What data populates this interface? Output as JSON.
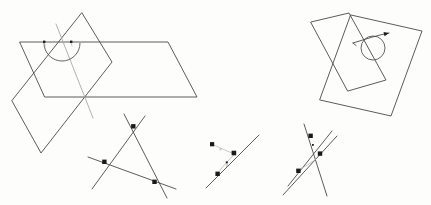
{
  "figure": {
    "background_color": "#fdfdfb",
    "width": 431,
    "height": 205,
    "stroke_color": "#4a4a4a",
    "accent_color": "#1a1a1a",
    "panels": [
      {
        "id": "panel-top-left",
        "name": "intersecting-planes-with-dihedral-angle",
        "description": "Two intersecting planes drawn as parallelograms with a dihedral angle arc and two right-angle tick marks on the line of intersection."
      },
      {
        "id": "panel-top-right",
        "name": "intersecting-planes-with-circle-and-arrow",
        "description": "Two overlapping parallelograms with a circle at the intersection region and an arrow pointing up-right."
      },
      {
        "id": "panel-bottom-left",
        "name": "triangle-from-three-lines",
        "description": "Three extended lines intersecting pairwise forming a triangle with three square vertex markers."
      },
      {
        "id": "panel-bottom-middle",
        "name": "line-with-offset-point",
        "description": "A diagonal line with two square markers and an offset square marker joined by a faint segment."
      },
      {
        "id": "panel-bottom-right",
        "name": "concurrent-lines-with-markers",
        "description": "Three lines crossing near a common region with four square markers."
      }
    ],
    "shapes": {
      "plane_a_left": [
        [
          20,
          42
        ],
        [
          168,
          42
        ],
        [
          197,
          97
        ],
        [
          45,
          97
        ]
      ],
      "plane_b_left": [
        [
          82,
          13
        ],
        [
          112,
          62
        ],
        [
          41,
          153
        ],
        [
          12,
          101
        ]
      ],
      "intersection_line_left": [
        [
          58,
          26
        ],
        [
          90,
          113
        ]
      ],
      "arc_left": {
        "cx": 62,
        "cy": 45,
        "r": 18
      },
      "ticks_left": [
        [
          44,
          43
        ],
        [
          71,
          42
        ]
      ],
      "plane_a_right": [
        [
          310,
          22
        ],
        [
          348,
          13
        ],
        [
          385,
          80
        ],
        [
          346,
          90
        ]
      ],
      "plane_b_right": [
        [
          325,
          44
        ],
        [
          365,
          33
        ],
        [
          421,
          47
        ],
        [
          381,
          57
        ]
      ],
      "circle_right": {
        "cx": 373,
        "cy": 46,
        "r": 12
      },
      "arrow_right": {
        "from": [
          352,
          42
        ],
        "to": [
          387,
          34
        ]
      }
    },
    "markers": {
      "bottom_left_vertices": [
        [
          134,
          127
        ],
        [
          105,
          162
        ],
        [
          155,
          182
        ]
      ],
      "bottom_middle_points": [
        [
          212,
          143
        ],
        [
          235,
          152
        ],
        [
          217,
          174
        ]
      ],
      "bottom_right_points": [
        [
          311,
          136
        ],
        [
          320,
          154
        ],
        [
          299,
          171
        ]
      ]
    },
    "labels": {
      "micro_1": "F",
      "micro_2": "A"
    }
  }
}
